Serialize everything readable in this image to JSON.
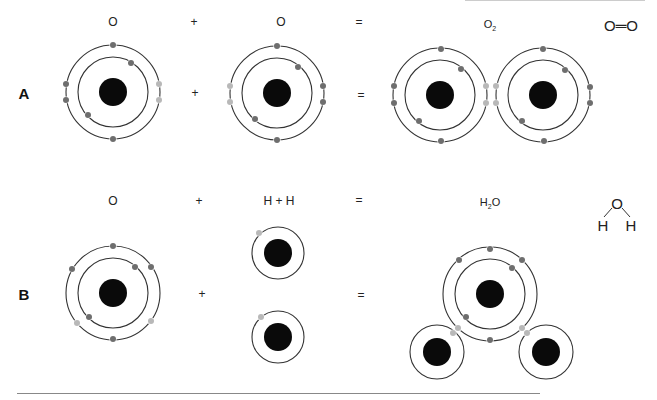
{
  "colors": {
    "nucleus": "#0a0a0a",
    "orbit": "#333333",
    "electron": "#6e6e6e",
    "shared_electron": "#b8b8b8"
  },
  "rows": [
    {
      "id": "A",
      "label": "A",
      "header": {
        "reactant1": "O",
        "plus": "+",
        "reactant2": "O",
        "equals": "=",
        "product_formula_main": "O",
        "product_formula_sub": "2",
        "structural": "O═O"
      },
      "operators": {
        "plus": "+",
        "equals": "="
      }
    },
    {
      "id": "B",
      "label": "B",
      "header": {
        "reactant1": "O",
        "plus": "+",
        "reactant2": "H + H",
        "equals": "=",
        "product_formula_main": "H",
        "product_formula_sub": "2",
        "product_formula_tail": "O",
        "structural_top": "O",
        "structural_left": "H",
        "structural_right": "H"
      },
      "operators": {
        "plus": "+",
        "equals": "="
      }
    }
  ],
  "atoms": [
    {
      "name": "row-a-oxygen-1",
      "cx": 113,
      "cy": 92,
      "shells": [
        35,
        47
      ],
      "nucleus_r": 14,
      "electrons": [
        {
          "x": 113,
          "y": 45,
          "c": "electron"
        },
        {
          "x": 131,
          "y": 63,
          "c": "electron"
        },
        {
          "x": 88,
          "y": 115,
          "c": "electron"
        },
        {
          "x": 113,
          "y": 139,
          "c": "electron"
        },
        {
          "x": 66,
          "y": 84,
          "c": "electron"
        },
        {
          "x": 66,
          "y": 100,
          "c": "electron"
        },
        {
          "x": 159,
          "y": 84,
          "c": "shared_electron"
        },
        {
          "x": 159,
          "y": 100,
          "c": "shared_electron"
        }
      ]
    },
    {
      "name": "row-a-oxygen-2",
      "cx": 277,
      "cy": 93,
      "shells": [
        35,
        47
      ],
      "nucleus_r": 14,
      "electrons": [
        {
          "x": 277,
          "y": 46,
          "c": "electron"
        },
        {
          "x": 298,
          "y": 67,
          "c": "electron"
        },
        {
          "x": 255,
          "y": 119,
          "c": "electron"
        },
        {
          "x": 277,
          "y": 140,
          "c": "electron"
        },
        {
          "x": 323,
          "y": 86,
          "c": "electron"
        },
        {
          "x": 323,
          "y": 102,
          "c": "electron"
        },
        {
          "x": 230,
          "y": 86,
          "c": "shared_electron"
        },
        {
          "x": 230,
          "y": 102,
          "c": "shared_electron"
        }
      ]
    },
    {
      "name": "o2-oxygen-left",
      "cx": 440,
      "cy": 95,
      "shells": [
        35,
        47
      ],
      "nucleus_r": 14,
      "electrons": [
        {
          "x": 441,
          "y": 49,
          "c": "electron"
        },
        {
          "x": 461,
          "y": 69,
          "c": "electron"
        },
        {
          "x": 419,
          "y": 121,
          "c": "electron"
        },
        {
          "x": 441,
          "y": 141,
          "c": "electron"
        },
        {
          "x": 394,
          "y": 86,
          "c": "electron"
        },
        {
          "x": 394,
          "y": 103,
          "c": "electron"
        },
        {
          "x": 486,
          "y": 86,
          "c": "shared_electron"
        },
        {
          "x": 486,
          "y": 103,
          "c": "shared_electron"
        }
      ]
    },
    {
      "name": "o2-oxygen-right",
      "cx": 543,
      "cy": 95,
      "shells": [
        35,
        47
      ],
      "nucleus_r": 14,
      "electrons": [
        {
          "x": 543,
          "y": 49,
          "c": "electron"
        },
        {
          "x": 565,
          "y": 70,
          "c": "electron"
        },
        {
          "x": 522,
          "y": 121,
          "c": "electron"
        },
        {
          "x": 544,
          "y": 141,
          "c": "electron"
        },
        {
          "x": 590,
          "y": 87,
          "c": "electron"
        },
        {
          "x": 590,
          "y": 103,
          "c": "electron"
        },
        {
          "x": 496,
          "y": 86,
          "c": "shared_electron"
        },
        {
          "x": 496,
          "y": 103,
          "c": "shared_electron"
        }
      ]
    },
    {
      "name": "row-b-oxygen",
      "cx": 113,
      "cy": 293,
      "shells": [
        35,
        47
      ],
      "nucleus_r": 14,
      "electrons": [
        {
          "x": 113,
          "y": 246,
          "c": "electron"
        },
        {
          "x": 135,
          "y": 267,
          "c": "electron"
        },
        {
          "x": 89,
          "y": 317,
          "c": "electron"
        },
        {
          "x": 113,
          "y": 339,
          "c": "electron"
        },
        {
          "x": 72,
          "y": 269,
          "c": "electron"
        },
        {
          "x": 151,
          "y": 267,
          "c": "electron"
        },
        {
          "x": 77,
          "y": 323,
          "c": "shared_electron"
        },
        {
          "x": 151,
          "y": 321,
          "c": "shared_electron"
        }
      ]
    },
    {
      "name": "hydrogen-top",
      "cx": 278,
      "cy": 253,
      "shells": [
        26
      ],
      "nucleus_r": 14,
      "electrons": [
        {
          "x": 259,
          "y": 233,
          "c": "shared_electron"
        }
      ]
    },
    {
      "name": "hydrogen-bottom",
      "cx": 278,
      "cy": 337,
      "shells": [
        26
      ],
      "nucleus_r": 14,
      "electrons": [
        {
          "x": 261,
          "y": 317,
          "c": "shared_electron"
        }
      ]
    },
    {
      "name": "h2o-oxygen",
      "cx": 490,
      "cy": 294,
      "shells": [
        35,
        47
      ],
      "nucleus_r": 14,
      "electrons": [
        {
          "x": 490,
          "y": 249,
          "c": "electron"
        },
        {
          "x": 512,
          "y": 268,
          "c": "electron"
        },
        {
          "x": 466,
          "y": 317,
          "c": "electron"
        },
        {
          "x": 490,
          "y": 340,
          "c": "electron"
        },
        {
          "x": 459,
          "y": 260,
          "c": "electron"
        },
        {
          "x": 522,
          "y": 260,
          "c": "electron"
        },
        {
          "x": 458,
          "y": 328,
          "c": "shared_electron"
        },
        {
          "x": 522,
          "y": 328,
          "c": "shared_electron"
        }
      ]
    },
    {
      "name": "h2o-hydrogen-left",
      "cx": 437,
      "cy": 352,
      "shells": [
        27
      ],
      "nucleus_r": 14,
      "electrons": [
        {
          "x": 453,
          "y": 333,
          "c": "shared_electron"
        }
      ]
    },
    {
      "name": "h2o-hydrogen-right",
      "cx": 546,
      "cy": 352,
      "shells": [
        27
      ],
      "nucleus_r": 14,
      "electrons": [
        {
          "x": 527,
          "y": 333,
          "c": "shared_electron"
        }
      ]
    }
  ]
}
